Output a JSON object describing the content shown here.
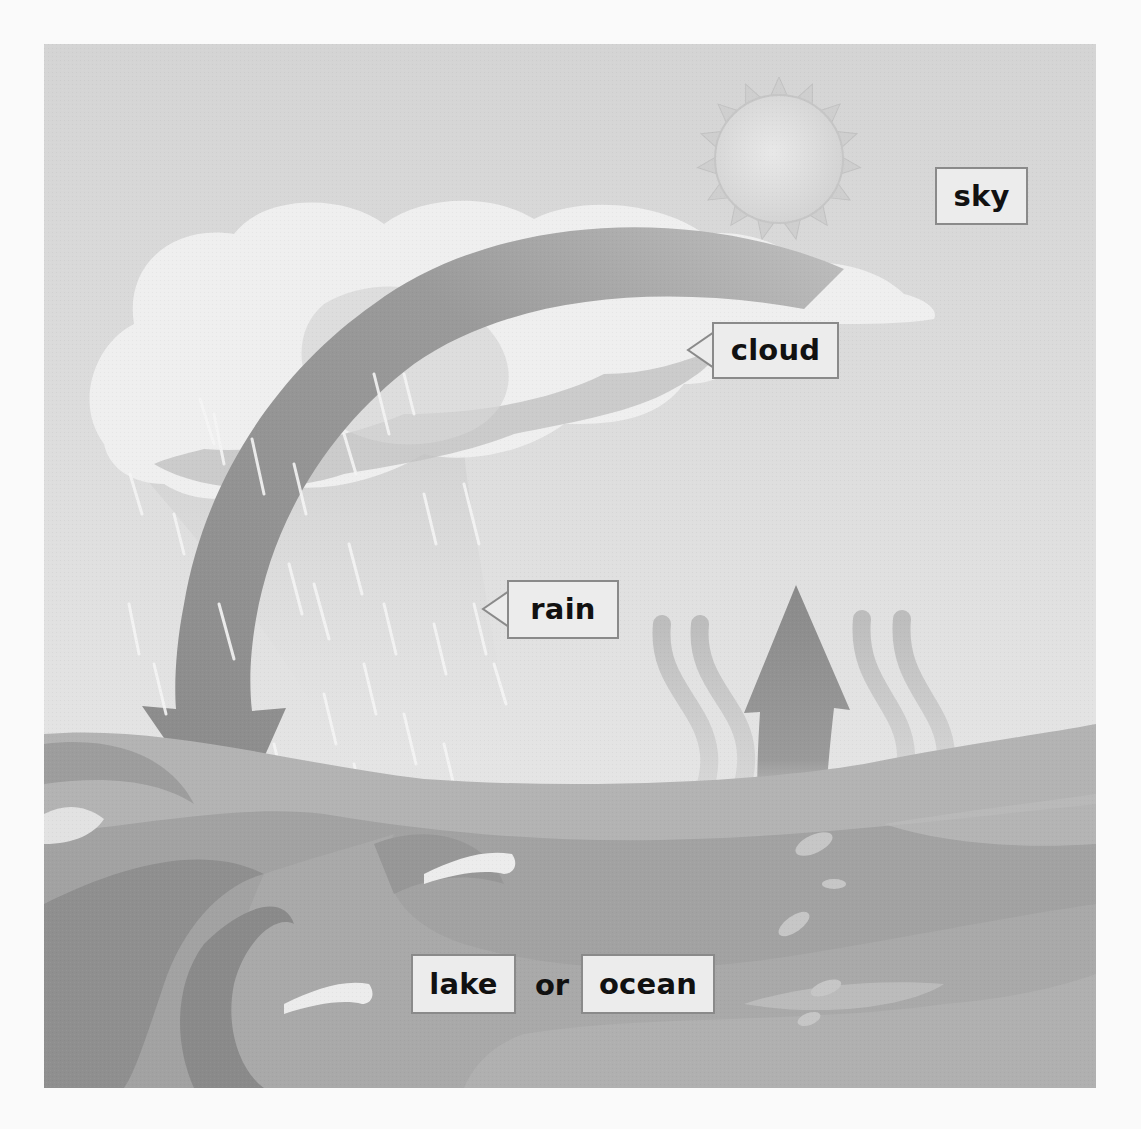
{
  "diagram": {
    "title": "Water cycle illustration",
    "style": "grayscale textbook illustration",
    "elements": [
      "sun",
      "cloud",
      "rain",
      "curved down arrow",
      "up arrow",
      "evaporation wavy lines",
      "waves"
    ],
    "labels": {
      "sky": "sky",
      "cloud": "cloud",
      "rain": "rain",
      "lake": "lake",
      "connector": "or",
      "ocean": "ocean"
    }
  },
  "colors": {
    "sky": "#dcdcdc",
    "label_bg": "#ececec",
    "label_border": "#8a8a8a",
    "label_text": "#111111",
    "arrow": "#8f8f8f",
    "water_dark": "#8c8c8c",
    "water_mid": "#a3a3a3",
    "water_light": "#b8b8b8",
    "cloud": "#f2f2f2",
    "sun": "#e3e3e3"
  }
}
